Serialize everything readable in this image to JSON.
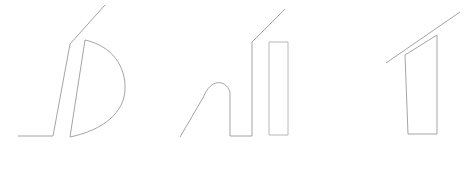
{
  "canvas": {
    "width": 465,
    "height": 189,
    "background_color": "#ffffff",
    "title": "line-drawing-sketch-canvas"
  },
  "style": {
    "stroke_color": "#9a9a9a",
    "stroke_color_light": "#b0b0b0",
    "stroke_width": 0.9,
    "fill": "none"
  },
  "figures": [
    {
      "name": "figure-left-d-shape",
      "label": "D shape with diagonal stroke and baseline",
      "strokes": [
        {
          "name": "stroke-left-diagonal-upper",
          "type": "polyline",
          "d": "M 105 5 L 70 44 L 53 136 L 18 136",
          "stroke": "#9a9a9a",
          "stroke_width": 0.9
        },
        {
          "name": "stroke-d-bowl-left-edge",
          "type": "polyline",
          "d": "M 85 40 L 70 137",
          "stroke": "#9a9a9a",
          "stroke_width": 0.9
        },
        {
          "name": "stroke-d-bowl-curve",
          "type": "path",
          "d": "M 85 40 C 112 46 126 66 125 90 C 124 112 104 130 70 137",
          "stroke": "#9a9a9a",
          "stroke_width": 0.9
        }
      ]
    },
    {
      "name": "figure-middle-arch-and-bar",
      "label": "Arch with diagonal stroke beside a tall rectangle",
      "strokes": [
        {
          "name": "stroke-arch-diagonal-and-hump",
          "type": "path",
          "d": "M 180 137 L 204 96 C 210 80 225 78 230 92 L 230 136 L 252 136 L 252 42 L 285 9",
          "stroke": "#9a9a9a",
          "stroke_width": 0.9
        },
        {
          "name": "stroke-tall-rectangle",
          "type": "polyline",
          "d": "M 269 42 L 288 42 L 288 135 L 269 135 Z",
          "stroke": "#b0b0b0",
          "stroke_width": 0.9
        }
      ]
    },
    {
      "name": "figure-right-wedge",
      "label": "Angled wedge polygon with diagonal stroke",
      "strokes": [
        {
          "name": "stroke-wedge-outline",
          "type": "polyline",
          "d": "M 437 35 L 405 55 L 408 134 L 437 134 Z",
          "stroke": "#9a9a9a",
          "stroke_width": 0.9
        },
        {
          "name": "stroke-wedge-diagonal",
          "type": "polyline",
          "d": "M 460 12 L 386 63",
          "stroke": "#9a9a9a",
          "stroke_width": 0.9
        }
      ]
    }
  ]
}
